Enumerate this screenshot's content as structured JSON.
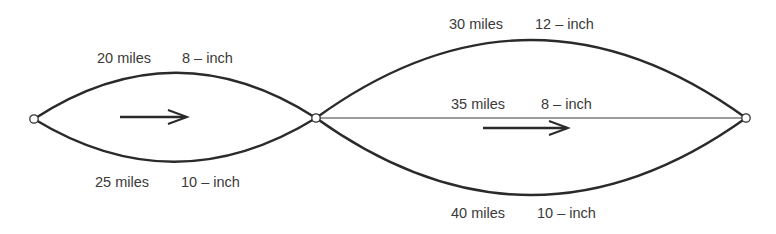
{
  "diagram": {
    "type": "pipeline-network",
    "nodes": [
      {
        "id": "source",
        "x": 34,
        "y": 119
      },
      {
        "id": "junction",
        "x": 316,
        "y": 118
      },
      {
        "id": "sink",
        "x": 746,
        "y": 118
      }
    ],
    "flow_arrows": [
      {
        "from_x": 120,
        "to_x": 187,
        "y": 117
      },
      {
        "from_x": 483,
        "to_x": 568,
        "y": 128
      }
    ],
    "pipes": [
      {
        "segment": "A",
        "position": "upper",
        "length": "20 miles",
        "diameter": "8 – inch"
      },
      {
        "segment": "A",
        "position": "lower",
        "length": "25 miles",
        "diameter": "10 – inch"
      },
      {
        "segment": "B",
        "position": "upper",
        "length": "30 miles",
        "diameter": "12 – inch"
      },
      {
        "segment": "B",
        "position": "middle",
        "length": "35 miles",
        "diameter": "8 – inch"
      },
      {
        "segment": "B",
        "position": "lower",
        "length": "40 miles",
        "diameter": "10 – inch"
      }
    ]
  },
  "colors": {
    "line": "#2a2a2a",
    "text": "#3a3a3a",
    "background": "#ffffff"
  }
}
